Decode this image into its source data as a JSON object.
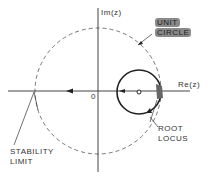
{
  "diagram": {
    "type": "z-plane root locus",
    "axes": {
      "imag_label": "Im(z)",
      "real_label": "Re(z)",
      "origin_label": "0"
    },
    "labels": {
      "unit_circle_line1": "UNIT",
      "unit_circle_line2": "CIRCLE",
      "root_locus_line1": "ROOT",
      "root_locus_line2": "LOCUS",
      "stability_line1": "STABILITY",
      "stability_line2": "LIMIT"
    },
    "colors": {
      "line": "#333333",
      "dashed": "#555555",
      "highlight": "#8a8a8a"
    }
  }
}
